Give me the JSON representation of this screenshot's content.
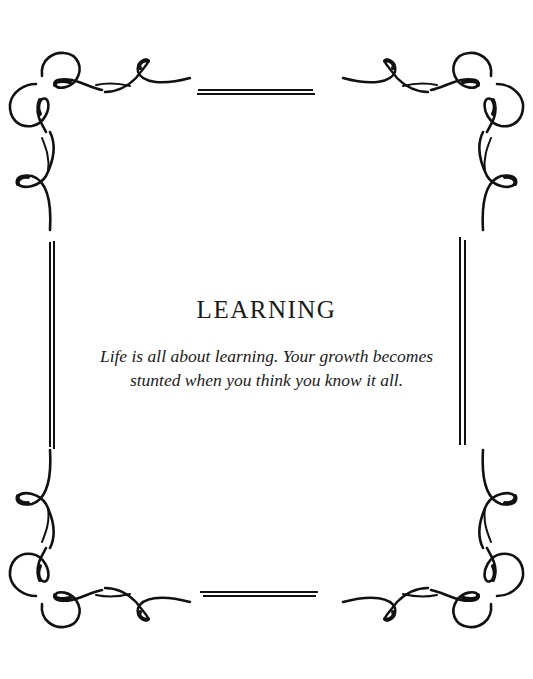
{
  "card": {
    "title": "LEARNING",
    "quote_line1": "Life is all about learning. Your growth becomes",
    "quote_line2": "stunted when you think you know it all."
  },
  "decoration": {
    "frame_style": "ornamental-flourish-border",
    "ink_color": "#111111",
    "background_color": "#ffffff"
  }
}
